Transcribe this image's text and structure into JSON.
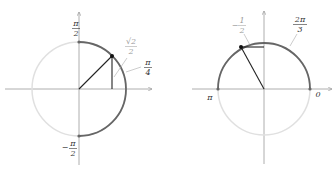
{
  "diagrams": [
    {
      "name": "left-unit-circle",
      "center": [
        79,
        89
      ],
      "radius": 47,
      "highlight_arc": {
        "from_deg": -90,
        "to_deg": 90
      },
      "point_angle_deg": 45,
      "projection": "vertical",
      "labels": {
        "top": {
          "num": "π",
          "den": "2"
        },
        "bottom": {
          "sign": "−",
          "num": "π",
          "den": "2"
        },
        "value": {
          "num": "√2",
          "den": "2"
        },
        "angle": {
          "num": "π",
          "den": "4"
        }
      }
    },
    {
      "name": "right-unit-circle",
      "center": [
        264,
        89
      ],
      "radius": 46,
      "highlight_arc": {
        "from_deg": 0,
        "to_deg": 180
      },
      "point_angle_deg": 120,
      "projection": "horizontal",
      "labels": {
        "value": {
          "sign": "−",
          "num": "1",
          "den": "2"
        },
        "angle": {
          "num": "2π",
          "den": "3"
        },
        "left": "π",
        "right": "0"
      }
    }
  ],
  "colors": {
    "axis": "#888888",
    "circle_light": "#dddddd",
    "arc_dark": "#666666",
    "radius_line": "#222222",
    "leader": "#999999"
  }
}
